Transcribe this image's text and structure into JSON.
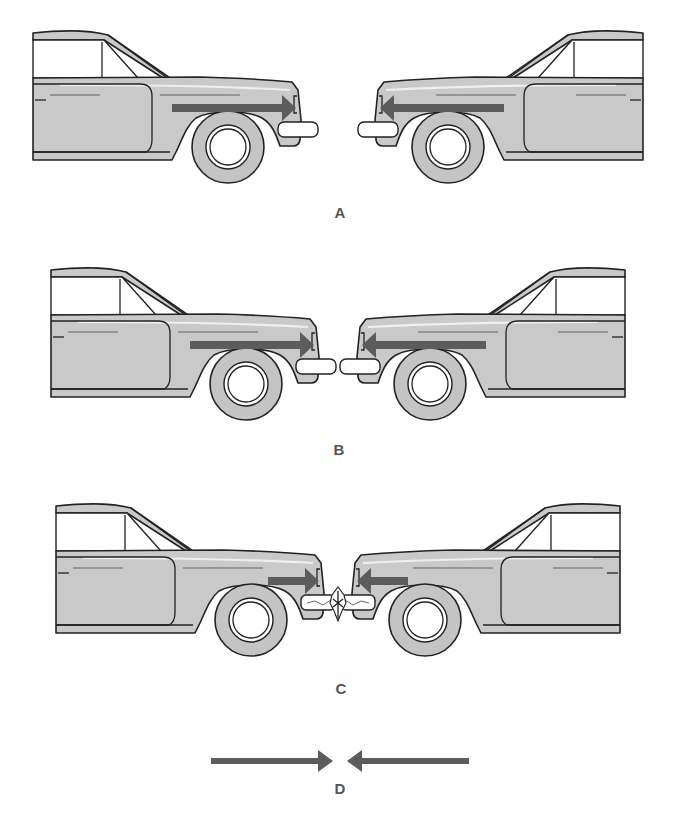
{
  "figure": {
    "colors": {
      "car_body": "#c9c9c9",
      "outline": "#222222",
      "force_arrow": "#5c5c5c",
      "label": "#555555",
      "background": "#ffffff"
    },
    "panels": [
      {
        "id": "A",
        "label": "A",
        "state": "approaching",
        "left_car_arrow": "right",
        "right_car_arrow": "left"
      },
      {
        "id": "B",
        "label": "B",
        "state": "bumpers touching",
        "left_car_arrow": "right",
        "right_car_arrow": "left"
      },
      {
        "id": "C",
        "label": "C",
        "state": "bumpers crushed on impact",
        "left_car_arrow": "right (short)",
        "right_car_arrow": "left (short)"
      },
      {
        "id": "D",
        "label": "D",
        "state": "force vectors only",
        "arrows": [
          "right-pointing",
          "left-pointing"
        ]
      }
    ]
  }
}
